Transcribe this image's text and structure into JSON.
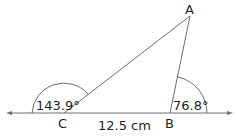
{
  "diagram": {
    "vertices": {
      "A": "A",
      "B": "B",
      "C": "C"
    },
    "angles": {
      "C": "143.9°",
      "B": "76.8°"
    },
    "side_CB": "12.5 cm",
    "colors": {
      "line": "#6d6e71",
      "text": "#231f20"
    }
  }
}
